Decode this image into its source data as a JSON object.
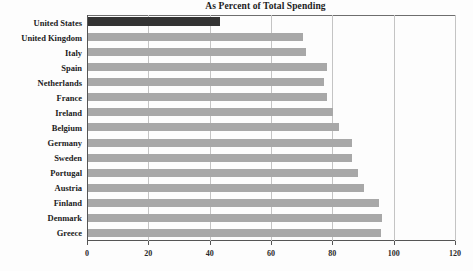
{
  "chart_data": {
    "type": "bar",
    "orientation": "horizontal",
    "title": "As Percent of Total Spending",
    "xlabel": "",
    "ylabel": "",
    "xlim": [
      0,
      120
    ],
    "xticks": [
      0,
      20,
      40,
      60,
      80,
      100,
      120
    ],
    "xtick_labels": [
      "0",
      "20",
      "40",
      "60",
      "80",
      "100",
      "120"
    ],
    "grid": true,
    "grid_axis": "x",
    "legend": false,
    "categories": [
      "United States",
      "United Kingdom",
      "Italy",
      "Spain",
      "Netherlands",
      "France",
      "Ireland",
      "Belgium",
      "Germany",
      "Sweden",
      "Portugal",
      "Austria",
      "Finland",
      "Denmark",
      "Greece"
    ],
    "values": [
      43,
      70,
      71,
      78,
      77,
      78,
      80,
      82,
      86,
      86,
      88,
      90,
      95,
      96,
      95.5
    ],
    "highlight_category": "United States",
    "colors": {
      "bar": "#a8a8a8",
      "highlight_bar": "#333333",
      "gridline": "#c4c4c4",
      "axis": "#555555",
      "background": "#fdfdfd",
      "text": "#1b1b1b"
    }
  }
}
